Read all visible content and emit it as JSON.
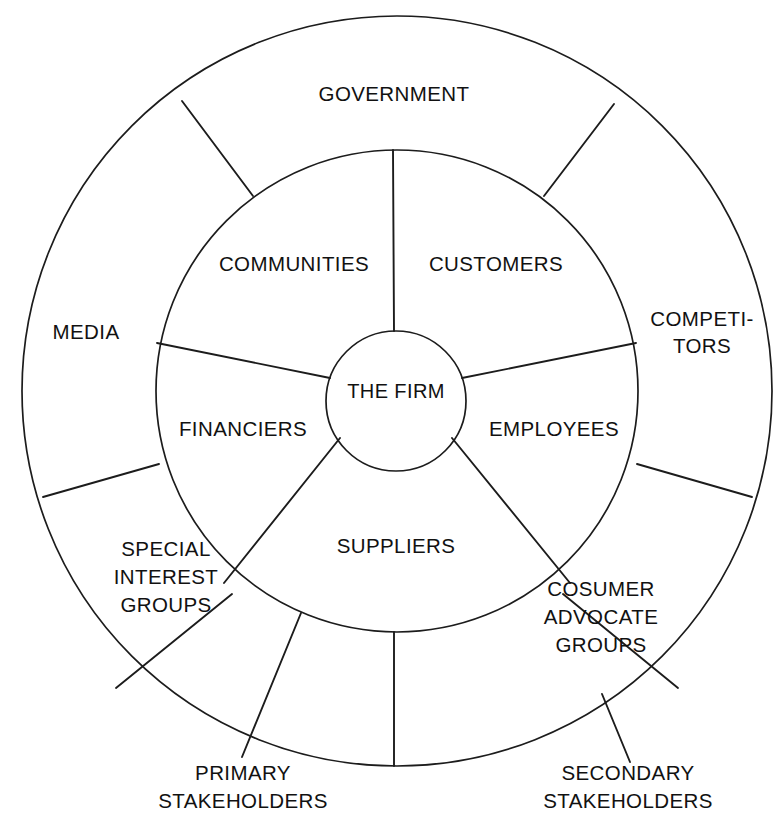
{
  "diagram": {
    "type": "concentric-ring-diagram",
    "background_color": "#ffffff",
    "stroke_color": "#1c1c1c",
    "text_color": "#111111"
  },
  "core": {
    "label": "THE FIRM"
  },
  "inner_ring": {
    "name": "primary-stakeholders-ring",
    "sectors": [
      {
        "id": "communities",
        "label": "COMMUNITIES"
      },
      {
        "id": "customers",
        "label": "CUSTOMERS"
      },
      {
        "id": "employees",
        "label": "EMPLOYEES"
      },
      {
        "id": "suppliers",
        "label": "SUPPLIERS"
      },
      {
        "id": "financiers",
        "label": "FINANCIERS"
      }
    ]
  },
  "outer_ring": {
    "name": "secondary-stakeholders-ring",
    "sectors": [
      {
        "id": "government",
        "label": "GOVERNMENT",
        "lines": [
          "GOVERNMENT"
        ]
      },
      {
        "id": "competitors",
        "label": "COMPETI-TORS",
        "lines": [
          "COMPETI-",
          "TORS"
        ]
      },
      {
        "id": "consumer-advocate-groups",
        "label": "COSUMER ADVOCATE GROUPS",
        "lines": [
          "COSUMER",
          "ADVOCATE",
          "GROUPS"
        ]
      },
      {
        "id": "special-interest-groups",
        "label": "SPECIAL INTEREST GROUPS",
        "lines": [
          "SPECIAL",
          "INTEREST",
          "GROUPS"
        ]
      },
      {
        "id": "media",
        "label": "MEDIA",
        "lines": [
          "MEDIA"
        ]
      }
    ]
  },
  "captions": [
    {
      "id": "primary",
      "lines": [
        "PRIMARY",
        "STAKEHOLDERS"
      ]
    },
    {
      "id": "secondary",
      "lines": [
        "SECONDARY",
        "STAKEHOLDERS"
      ]
    }
  ]
}
